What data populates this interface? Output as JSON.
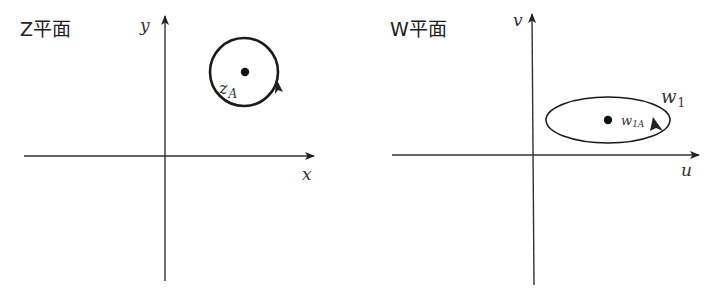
{
  "panels": [
    {
      "title": "Z平面",
      "axes": {
        "horizontal": "x",
        "vertical": "y"
      },
      "curve": {
        "shape": "circle",
        "orientation": "counterclockwise"
      },
      "point": {
        "label_main": "z",
        "label_sub": "A"
      }
    },
    {
      "title": "W平面",
      "axes": {
        "horizontal": "u",
        "vertical": "v"
      },
      "curve": {
        "shape": "ellipse",
        "orientation": "counterclockwise",
        "label_main": "w",
        "label_sub": "1"
      },
      "point": {
        "label_main": "w",
        "label_sub": "1A"
      }
    }
  ]
}
